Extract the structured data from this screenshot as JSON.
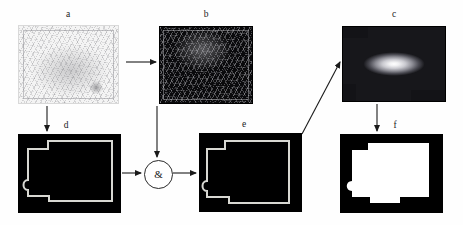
{
  "figure": {
    "type": "diagram",
    "background_color": "#ffffff",
    "width": 463,
    "height": 225
  },
  "panels": [
    {
      "id": "a",
      "label": "a",
      "kind": "grayscale-scanned-map",
      "position": {
        "x": 18,
        "y": 25,
        "w": 101,
        "h": 79
      },
      "appearance": "faded light-gray scanned topographic map with thin hatched line work and a darker blob lower-right"
    },
    {
      "id": "b",
      "label": "b",
      "kind": "edge-magnitude-image",
      "position": {
        "x": 159,
        "y": 26,
        "w": 94,
        "h": 78
      },
      "appearance": "dark near-black image with bright thin filamentary edge responses"
    },
    {
      "id": "c",
      "label": "c",
      "kind": "distance-transform",
      "position": {
        "x": 342,
        "y": 26,
        "w": 104,
        "h": 76
      },
      "appearance": "radial glow, white hot core fading to black at the frame border"
    },
    {
      "id": "d",
      "label": "d",
      "kind": "binary-mask-black-fill",
      "position": {
        "x": 18,
        "y": 134,
        "w": 103,
        "h": 79
      },
      "appearance": "solid black region with a thin light contour tracing an irregular notched rectangle"
    },
    {
      "id": "e",
      "label": "e",
      "kind": "binary-mask-black-fill",
      "position": {
        "x": 199,
        "y": 133,
        "w": 103,
        "h": 79
      },
      "appearance": "solid black region with a thin light contour, result of the logical AND"
    },
    {
      "id": "f",
      "label": "f",
      "kind": "binary-mask-white-fill",
      "position": {
        "x": 340,
        "y": 134,
        "w": 103,
        "h": 79
      },
      "appearance": "inverted mask: thick black frame enclosing a white irregular notched region"
    }
  ],
  "gate": {
    "symbol": "&",
    "name": "logical-and-gate",
    "position": {
      "x": 144,
      "y": 160,
      "w": 27,
      "h": 27
    }
  },
  "arrows": [
    {
      "name": "a-to-b",
      "from": "a",
      "to": "b",
      "orientation": "horizontal-right"
    },
    {
      "name": "a-to-d",
      "from": "a",
      "to": "d",
      "orientation": "vertical-down"
    },
    {
      "name": "b-to-gate",
      "from": "b",
      "to": "gate",
      "orientation": "vertical-down"
    },
    {
      "name": "d-to-gate",
      "from": "d",
      "to": "gate",
      "orientation": "horizontal-right"
    },
    {
      "name": "gate-to-e",
      "from": "gate",
      "to": "e",
      "orientation": "horizontal-right"
    },
    {
      "name": "e-to-c",
      "from": "e",
      "to": "c",
      "orientation": "diagonal-up-right"
    },
    {
      "name": "c-to-f",
      "from": "c",
      "to": "f",
      "orientation": "vertical-down"
    }
  ],
  "colors": {
    "stroke": "#1a1a1a",
    "mask_fill": "#000000",
    "contour": "#d8d8d2",
    "page": "#ffffff"
  }
}
